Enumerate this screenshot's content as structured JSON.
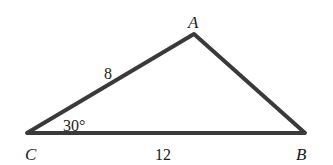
{
  "diagram": {
    "type": "triangle",
    "vertices": [
      {
        "name": "A",
        "x": 194,
        "y": 34
      },
      {
        "name": "B",
        "x": 305,
        "y": 133
      },
      {
        "name": "C",
        "x": 27,
        "y": 133
      }
    ],
    "labels": {
      "vertex_a": "A",
      "vertex_b": "B",
      "vertex_c": "C",
      "side_ca": "8",
      "side_cb": "12",
      "angle_c": "30°"
    },
    "stroke_color": "#3a3a3a"
  }
}
